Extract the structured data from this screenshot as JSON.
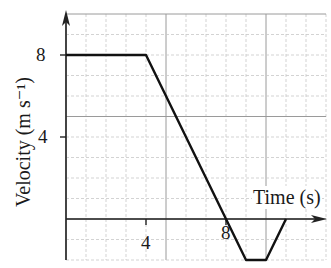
{
  "chart_data": {
    "type": "line",
    "title": "",
    "xlabel": "Time (s)",
    "ylabel": "Velocity (m s⁻¹)",
    "x_ticks": [
      4,
      8
    ],
    "y_ticks": [
      4,
      8
    ],
    "xlim": [
      0,
      13
    ],
    "ylim": [
      -2,
      10
    ],
    "grid": true,
    "series": [
      {
        "name": "velocity",
        "x": [
          0,
          4,
          8,
          9,
          10,
          11
        ],
        "y": [
          8,
          8,
          0,
          -2,
          -2,
          0
        ]
      }
    ]
  },
  "labels": {
    "xtick_4": "4",
    "xtick_8": "8",
    "ytick_4": "4",
    "ytick_8": "8",
    "xlabel": "Time (s)",
    "ylabel": "Velocity (m s⁻¹)"
  }
}
